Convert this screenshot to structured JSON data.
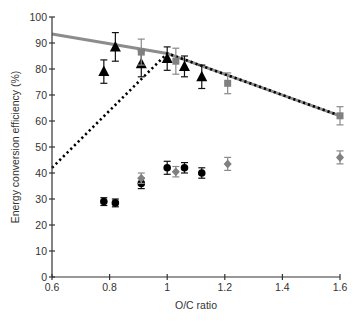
{
  "chart_data": {
    "type": "scatter",
    "title": "",
    "xlabel": "O/C ratio",
    "ylabel": "Energy conversion efficiency (%)",
    "xlim": [
      0.6,
      1.6
    ],
    "ylim": [
      0,
      100
    ],
    "xticks": [
      0.6,
      0.8,
      1,
      1.2,
      1.4,
      1.6
    ],
    "xtick_labels": [
      "0.6",
      "0.8",
      "1",
      "1.2",
      "1.4",
      "1.6"
    ],
    "yticks": [
      0,
      10,
      20,
      30,
      40,
      50,
      60,
      70,
      80,
      90,
      100
    ],
    "ytick_labels": [
      "0",
      "10",
      "20",
      "30",
      "40",
      "50",
      "60",
      "70",
      "80",
      "90",
      "100"
    ],
    "grid": false,
    "legend": null,
    "series": [
      {
        "name": "triangles",
        "marker": "triangle",
        "color": "#000000",
        "x": [
          0.78,
          0.82,
          0.91,
          1.0,
          1.06,
          1.12
        ],
        "y": [
          79,
          88.5,
          82,
          84,
          81,
          77
        ],
        "err": [
          4.5,
          5.5,
          5,
          4.5,
          4,
          4.5
        ]
      },
      {
        "name": "squares",
        "marker": "square",
        "color": "#808080",
        "x": [
          0.91,
          1.03,
          1.21,
          1.6
        ],
        "y": [
          86.5,
          83,
          74.5,
          62
        ],
        "err": [
          5,
          5,
          4,
          3.5
        ]
      },
      {
        "name": "circles",
        "marker": "circle",
        "color": "#000000",
        "x": [
          0.78,
          0.82,
          0.91,
          1.0,
          1.06,
          1.12
        ],
        "y": [
          29,
          28.5,
          36,
          42,
          42,
          40
        ],
        "err": [
          1.5,
          1.5,
          2,
          2.5,
          2,
          2
        ]
      },
      {
        "name": "diamonds",
        "marker": "diamond",
        "color": "#808080",
        "x": [
          0.91,
          1.03,
          1.21,
          1.6
        ],
        "y": [
          38,
          40.5,
          43.5,
          46
        ],
        "err": [
          2,
          2,
          2.5,
          2.5
        ]
      }
    ],
    "lines": [
      {
        "name": "gray-solid-line",
        "style": "solid",
        "color": "#8c8c8c",
        "x": [
          0.6,
          1.0,
          1.6
        ],
        "y": [
          93.5,
          86,
          62
        ]
      },
      {
        "name": "black-dotted-line",
        "style": "dotted",
        "color": "#000000",
        "x": [
          0.6,
          1.0,
          1.6
        ],
        "y": [
          42,
          86,
          62
        ]
      }
    ]
  }
}
